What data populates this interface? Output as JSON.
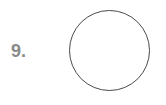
{
  "item": {
    "number_label": "9.",
    "shape": "circle-outline",
    "colors": {
      "number": "#8a8a8a",
      "stroke": "#4a4a4a",
      "background": "#ffffff"
    }
  }
}
